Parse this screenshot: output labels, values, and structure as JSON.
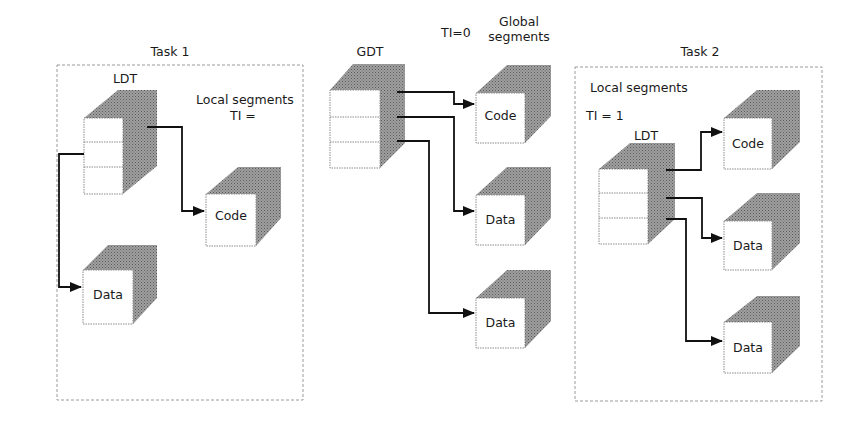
{
  "colors": {
    "background": "#ffffff",
    "line": "#111111",
    "cube_shade": "#8a8a8a",
    "cube_face": "#ffffff",
    "dashed_border": "#9a9a9a"
  },
  "task1": {
    "title": "Task 1",
    "table_label": "LDT",
    "segments_label": "Local segments",
    "ti_label": "TI =",
    "segments": [
      {
        "label": "Code"
      },
      {
        "label": "Data"
      }
    ]
  },
  "global": {
    "ti_label": "TI=0",
    "segments_label_line1": "Global",
    "segments_label_line2": "segments",
    "table_label": "GDT",
    "segments": [
      {
        "label": "Code"
      },
      {
        "label": "Data"
      },
      {
        "label": "Data"
      }
    ]
  },
  "task2": {
    "title": "Task 2",
    "table_label": "LDT",
    "segments_label": "Local segments",
    "ti_label": "TI = 1",
    "segments": [
      {
        "label": "Code"
      },
      {
        "label": "Data"
      },
      {
        "label": "Data"
      }
    ]
  }
}
